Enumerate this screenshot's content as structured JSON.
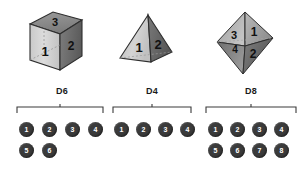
{
  "figure": {
    "type": "diagram"
  },
  "dice": [
    {
      "id": "d6",
      "label": "D6",
      "shape_name": "cube",
      "visible_face_numbers": [
        "3",
        "1",
        "2"
      ],
      "faces": 6,
      "colors": {
        "front": "#d0d0d0",
        "right": "#6e6e6e",
        "top": "#8a8a8a",
        "edge": "#2b2b2b"
      },
      "outcomes": [
        [
          "1",
          "2",
          "3",
          "4"
        ],
        [
          "5",
          "6"
        ]
      ]
    },
    {
      "id": "d4",
      "label": "D4",
      "shape_name": "tetrahedron",
      "visible_face_numbers": [
        "1",
        "2"
      ],
      "faces": 4,
      "colors": {
        "front": "#c6c6c6",
        "right": "#6a6a6a",
        "top": "#9a9a9a",
        "edge": "#2b2b2b"
      },
      "outcomes": [
        [
          "1",
          "2",
          "3",
          "4"
        ]
      ]
    },
    {
      "id": "d8",
      "label": "D8",
      "shape_name": "octahedron",
      "visible_face_numbers": [
        "3",
        "1",
        "4",
        "2"
      ],
      "faces": 8,
      "colors": {
        "front": "#b6b6b6",
        "right": "#6e6e6e",
        "top": "#949494",
        "edge": "#2b2b2b"
      },
      "outcomes": [
        [
          "1",
          "2",
          "3",
          "4"
        ],
        [
          "5",
          "6",
          "7",
          "8"
        ]
      ]
    }
  ],
  "pip_style": {
    "fill": "#3b3b3b",
    "text": "#ffffff"
  },
  "bracket_style": {
    "stroke": "#3a3a3a"
  }
}
